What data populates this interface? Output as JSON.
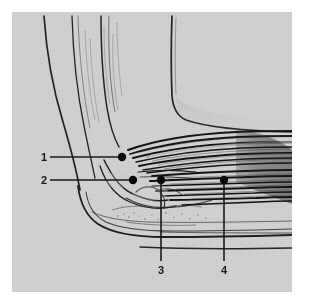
{
  "figure": {
    "kind": "anatomical-illustration",
    "style": "halftone grayscale line drawing",
    "panel": {
      "background_color": "#d3d3d3",
      "page_color": "#ffffff",
      "ink_color": "#1a1a1a",
      "left": 12,
      "top": 12,
      "width": 280,
      "height": 280
    }
  },
  "labels": [
    {
      "id": "label-1",
      "text": "1",
      "leader": "horizontal",
      "text_x": 41,
      "text_y": 152,
      "line_x1": 50,
      "line_y1": 157,
      "line_x2": 122,
      "line_y2": 157,
      "dot_x": 122,
      "dot_y": 157,
      "dot_r": 4.2
    },
    {
      "id": "label-2",
      "text": "2",
      "leader": "horizontal",
      "text_x": 41,
      "text_y": 175,
      "line_x1": 50,
      "line_y1": 180,
      "line_x2": 133,
      "line_y2": 180,
      "dot_x": 133,
      "dot_y": 180,
      "dot_r": 4.2
    },
    {
      "id": "label-3",
      "text": "3",
      "leader": "vertical",
      "text_x": 158,
      "text_y": 265,
      "line_x1": 161,
      "line_y1": 180,
      "line_x2": 161,
      "line_y2": 261,
      "dot_x": 161,
      "dot_y": 180,
      "dot_r": 4.2
    },
    {
      "id": "label-4",
      "text": "4",
      "leader": "vertical",
      "text_x": 221,
      "text_y": 265,
      "line_x1": 224,
      "line_y1": 180,
      "line_x2": 224,
      "line_y2": 261,
      "dot_x": 224,
      "dot_y": 180,
      "dot_r": 4.2
    }
  ],
  "colors": {
    "page": "#ffffff",
    "plate": "#d3d3d3",
    "ink": "#1a1a1a",
    "ink_mid": "#4a4a4a",
    "ink_light": "#7a7a7a"
  }
}
